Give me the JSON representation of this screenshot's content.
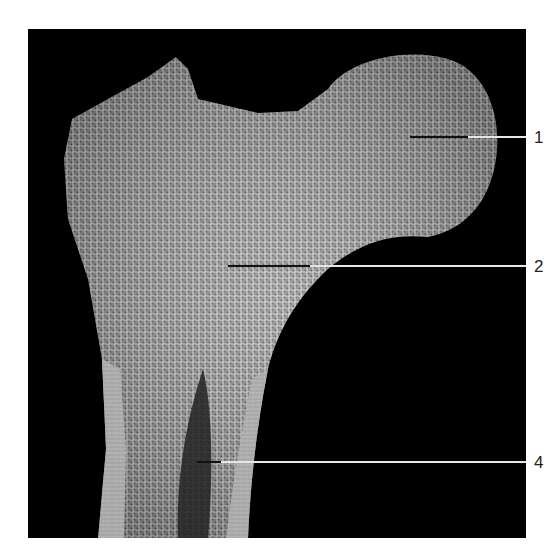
{
  "figure": {
    "background_color": "#000000",
    "page_color": "#ffffff",
    "bone_color": "#b8b8b8"
  },
  "labels": [
    {
      "id": "1",
      "text": "1",
      "y": 137,
      "line_start_x": 410
    },
    {
      "id": "2",
      "text": "2",
      "y": 266,
      "line_start_x": 228
    },
    {
      "id": "4",
      "text": "4",
      "y": 462,
      "line_start_x": 197
    }
  ]
}
